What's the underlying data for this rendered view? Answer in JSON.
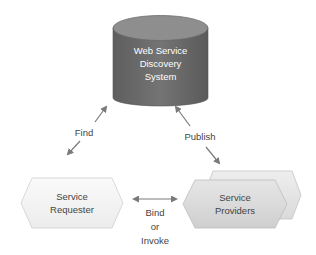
{
  "diagram": {
    "title": "",
    "nodes": {
      "registry": {
        "line1": "Web Service",
        "line2": "Discovery",
        "line3": "System",
        "shape": "cylinder",
        "fill": "#6b6b6b",
        "top_fill": "#8f8f8f"
      },
      "requester": {
        "line1": "Service",
        "line2": "Requester",
        "shape": "hexagon",
        "fill": "#f4f4f4"
      },
      "providers": {
        "line1": "Service",
        "line2": "Providers",
        "shape": "stacked-hexagon",
        "fill": "#dcdcdc"
      }
    },
    "edges": {
      "find": {
        "label": "Find",
        "from": "registry",
        "to": "requester",
        "direction": "bidirectional"
      },
      "publish": {
        "label": "Publish",
        "from": "registry",
        "to": "providers",
        "direction": "bidirectional"
      },
      "bind": {
        "label_line1": "Bind",
        "label_line2": "or",
        "label_line3": "Invoke",
        "from": "requester",
        "to": "providers",
        "direction": "bidirectional"
      }
    },
    "colors": {
      "arrow": "#7a7a7a",
      "text_dark": "#444444",
      "text_light": "#ffffff",
      "outline": "#bdbdbd"
    }
  }
}
